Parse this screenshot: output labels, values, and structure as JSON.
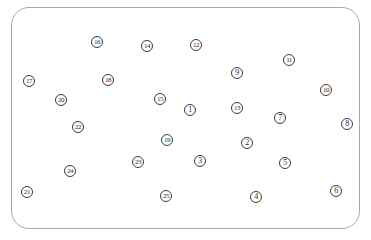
{
  "canvas": {
    "width": 371,
    "height": 240,
    "border_color": "#a8a8a8",
    "marker_color": "#3a3a3a"
  },
  "markers": [
    {
      "label": "1",
      "x": 190,
      "y": 110
    },
    {
      "label": "2",
      "x": 247,
      "y": 143
    },
    {
      "label": "3",
      "x": 200,
      "y": 161
    },
    {
      "label": "4",
      "x": 256,
      "y": 197
    },
    {
      "label": "5",
      "x": 285,
      "y": 163
    },
    {
      "label": "6",
      "x": 336,
      "y": 191
    },
    {
      "label": "7",
      "x": 280,
      "y": 118
    },
    {
      "label": "8",
      "x": 347,
      "y": 124
    },
    {
      "label": "9",
      "x": 237,
      "y": 73
    },
    {
      "label": "10",
      "x": 326,
      "y": 90
    },
    {
      "label": "11",
      "x": 289,
      "y": 60
    },
    {
      "label": "12",
      "x": 196,
      "y": 45
    },
    {
      "label": "13",
      "x": 237,
      "y": 108
    },
    {
      "label": "14",
      "x": 147,
      "y": 46
    },
    {
      "label": "15",
      "x": 160,
      "y": 99
    },
    {
      "label": "16",
      "x": 97,
      "y": 42
    },
    {
      "label": "17",
      "x": 29,
      "y": 81
    },
    {
      "label": "18",
      "x": 108,
      "y": 80
    },
    {
      "label": "19",
      "x": 167,
      "y": 140
    },
    {
      "label": "20",
      "x": 61,
      "y": 100
    },
    {
      "label": "21",
      "x": 27,
      "y": 192
    },
    {
      "label": "22",
      "x": 78,
      "y": 127
    },
    {
      "label": "23",
      "x": 138,
      "y": 162
    },
    {
      "label": "24",
      "x": 70,
      "y": 171
    },
    {
      "label": "25",
      "x": 166,
      "y": 196
    }
  ]
}
